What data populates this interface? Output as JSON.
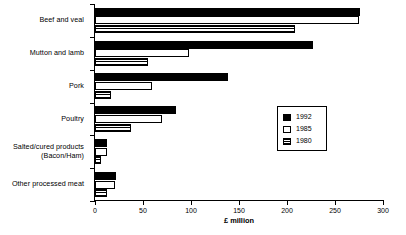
{
  "chart_data": {
    "type": "bar",
    "orientation": "horizontal",
    "title": "",
    "xlabel": "£ million",
    "ylabel": "",
    "xlim": [
      0,
      300
    ],
    "xticks": [
      0,
      50,
      100,
      150,
      200,
      250,
      300
    ],
    "xtick_labels": [
      "0",
      "50",
      "100",
      "150",
      "200",
      "250",
      "300"
    ],
    "grid": false,
    "legend_position": "center-right",
    "categories": [
      "Beef and veal",
      "Mutton and lamb",
      "Pork",
      "Poultry",
      "Salted/cured products\n(Bacon/Ham)",
      "Other processed meat"
    ],
    "series": [
      {
        "name": "1992",
        "fill": "solid-black",
        "color": "#000000",
        "values": [
          276,
          227,
          139,
          84,
          13,
          22
        ]
      },
      {
        "name": "1985",
        "fill": "white-outline",
        "color": "#ffffff",
        "values": [
          275,
          98,
          59,
          70,
          12,
          21
        ]
      },
      {
        "name": "1980",
        "fill": "horizontal-stripes",
        "color": "#000000",
        "values": [
          208,
          55,
          17,
          38,
          6,
          12
        ]
      }
    ]
  },
  "legend": {
    "entries": [
      {
        "label": "1992",
        "swatch": "solid-black"
      },
      {
        "label": "1985",
        "swatch": "white-outline"
      },
      {
        "label": "1980",
        "swatch": "horizontal-stripes"
      }
    ]
  },
  "axis": {
    "x_title": "£ million"
  }
}
